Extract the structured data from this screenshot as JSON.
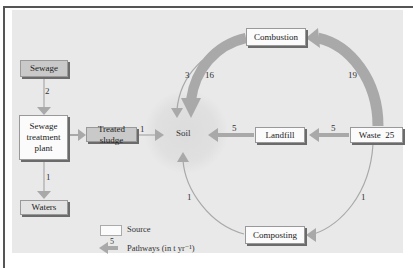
{
  "nodes": {
    "sewage": "Sewage",
    "sewage_treatment_plant": "Sewage treatment plant",
    "treated_sludge": "Treated sludge",
    "waters": "Waters",
    "soil": "Soil",
    "combustion": "Combustion",
    "landfill": "Landfill",
    "waste": "Waste  25",
    "composting": "Composting"
  },
  "flows": {
    "sewage_to_plant": "2",
    "plant_to_waters": "1",
    "sludge_to_soil": "1",
    "combustion_to_soil_thin": "3",
    "combustion_to_soil_thick": "16",
    "waste_to_combustion": "19",
    "waste_to_landfill": "5",
    "landfill_to_soil": "5",
    "waste_to_composting": "1",
    "composting_to_soil": "1"
  },
  "legend": {
    "source_label": "Source",
    "pathway_value": "5",
    "pathway_label": "Pathways (in t yr⁻¹)"
  },
  "colors": {
    "panel": "#e9e9e9",
    "arrow": "#a9a9a9",
    "grey_node": "#c9c9c9",
    "white_node": "#fbfbfb"
  }
}
